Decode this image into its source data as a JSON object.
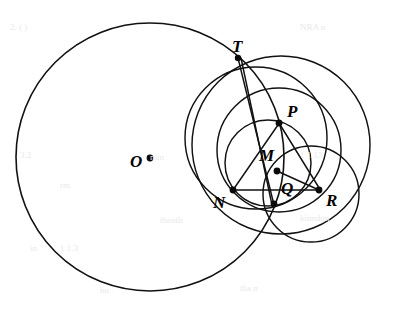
{
  "figure": {
    "kind": "euclidean-geometry-diagram",
    "canvas": {
      "width": 393,
      "height": 315
    },
    "stroke_color": "#111111",
    "background_color": "#ffffff",
    "dot_color": "#0a0a0a",
    "label_color": "#000000"
  },
  "labels": [
    {
      "id": "T",
      "text": "T",
      "x": 232,
      "y": 38
    },
    {
      "id": "P",
      "text": "P",
      "x": 287,
      "y": 103
    },
    {
      "id": "M",
      "text": "M",
      "x": 259,
      "y": 147
    },
    {
      "id": "O",
      "text": "O",
      "x": 130,
      "y": 153
    },
    {
      "id": "N",
      "text": "N",
      "x": 213,
      "y": 194
    },
    {
      "id": "Q",
      "text": "Q",
      "x": 281,
      "y": 180
    },
    {
      "id": "R",
      "text": "R",
      "x": 326,
      "y": 192
    }
  ],
  "points": [
    {
      "id": "O",
      "x": 150,
      "y": 158,
      "r": 3.4
    },
    {
      "id": "T",
      "x": 238,
      "y": 58,
      "r": 3.2
    },
    {
      "id": "P",
      "x": 279,
      "y": 123,
      "r": 3.4
    },
    {
      "id": "M",
      "x": 277,
      "y": 171,
      "r": 3.4
    },
    {
      "id": "N",
      "x": 233,
      "y": 190,
      "r": 3.4
    },
    {
      "id": "Q",
      "x": 274,
      "y": 204,
      "r": 3.4
    },
    {
      "id": "R",
      "x": 319,
      "y": 190,
      "r": 3.4
    }
  ],
  "circles": [
    {
      "id": "circle-O",
      "name": "main-circle-center-O",
      "cx": 150,
      "cy": 157,
      "r": 134
    },
    {
      "id": "circle-TNQ",
      "name": "circle-through-T-N-Q",
      "cx": 256,
      "cy": 138,
      "r": 71
    },
    {
      "id": "circle-TR",
      "name": "large-right-circle-through-T-R",
      "cx": 281,
      "cy": 145,
      "r": 89
    },
    {
      "id": "circle-mid",
      "name": "middle-circle-through-P-Q",
      "cx": 279,
      "cy": 150,
      "r": 62
    },
    {
      "id": "circle-PMQN",
      "name": "small-circle-through-P-M-Q-N",
      "cx": 268,
      "cy": 163,
      "r": 43
    },
    {
      "id": "circle-QR",
      "name": "bottom-right-circle-through-Q-R",
      "cx": 311,
      "cy": 194,
      "r": 48
    }
  ],
  "segments": [
    {
      "id": "seg-T-Q-a",
      "name": "chord-T-to-Q-upper",
      "x1": 238,
      "y1": 58,
      "x2": 274,
      "y2": 205
    },
    {
      "id": "seg-T-Q-b",
      "name": "chord-T-to-Q-lower",
      "x1": 241,
      "y1": 58,
      "x2": 272,
      "y2": 205
    },
    {
      "id": "seg-P-R",
      "name": "chord-P-to-R",
      "x1": 279,
      "y1": 123,
      "x2": 321,
      "y2": 191
    },
    {
      "id": "seg-N-R",
      "name": "chord-N-to-R",
      "x1": 232,
      "y1": 190,
      "x2": 320,
      "y2": 190
    },
    {
      "id": "seg-N-P",
      "name": "chord-N-to-P",
      "x1": 233,
      "y1": 190,
      "x2": 280,
      "y2": 122
    },
    {
      "id": "seg-M-R",
      "name": "chord-M-to-R",
      "x1": 277,
      "y1": 171,
      "x2": 319,
      "y2": 190
    }
  ],
  "ghost_marks": [
    {
      "text": "2. ( )",
      "x": 10,
      "y": 22
    },
    {
      "text": "NRA n",
      "x": 300,
      "y": 22
    },
    {
      "text": "3.2",
      "x": 20,
      "y": 150
    },
    {
      "text": "min",
      "x": 150,
      "y": 152
    },
    {
      "text": "1 1.13",
      "x": 300,
      "y": 150
    },
    {
      "text": "rm",
      "x": 60,
      "y": 180
    },
    {
      "text": "thenth",
      "x": 160,
      "y": 215
    },
    {
      "text": "in",
      "x": 30,
      "y": 243
    },
    {
      "text": "1 1.3",
      "x": 60,
      "y": 243
    },
    {
      "text": "kinndun",
      "x": 300,
      "y": 213
    },
    {
      "text": "hu",
      "x": 100,
      "y": 285
    },
    {
      "text": "tha n",
      "x": 240,
      "y": 283
    }
  ]
}
